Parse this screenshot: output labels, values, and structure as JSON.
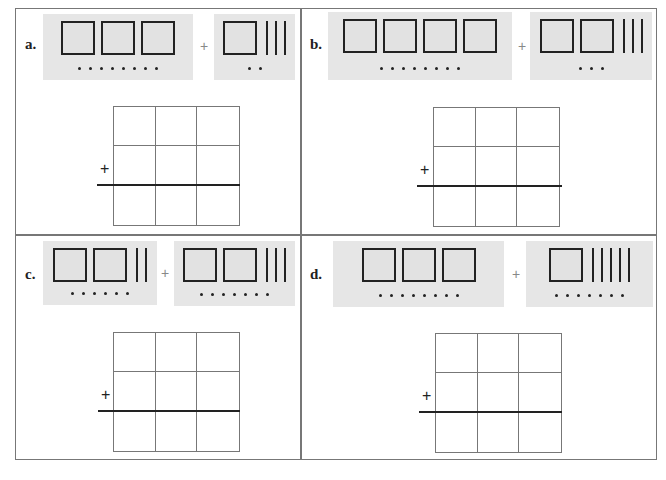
{
  "worksheet": {
    "problems": [
      {
        "label": "a.",
        "left": {
          "flats": 3,
          "rods": 0,
          "units": 8
        },
        "operator": "+",
        "right": {
          "flats": 1,
          "rods": 3,
          "units": 2
        },
        "grid_operator": "+"
      },
      {
        "label": "b.",
        "left": {
          "flats": 4,
          "rods": 0,
          "units": 8
        },
        "operator": "+",
        "right": {
          "flats": 2,
          "rods": 3,
          "units": 3
        },
        "grid_operator": "+"
      },
      {
        "label": "c.",
        "left": {
          "flats": 2,
          "rods": 2,
          "units": 6
        },
        "operator": "+",
        "right": {
          "flats": 2,
          "rods": 3,
          "units": 7
        },
        "grid_operator": "+"
      },
      {
        "label": "d.",
        "left": {
          "flats": 3,
          "rods": 0,
          "units": 8
        },
        "operator": "+",
        "right": {
          "flats": 1,
          "rods": 5,
          "units": 7
        },
        "grid_operator": "+"
      }
    ],
    "answer_grid": {
      "rows": 3,
      "cols": 3
    },
    "colors": {
      "block_background": "#e6e6e6",
      "border": "#777777",
      "ink": "#222222"
    }
  }
}
